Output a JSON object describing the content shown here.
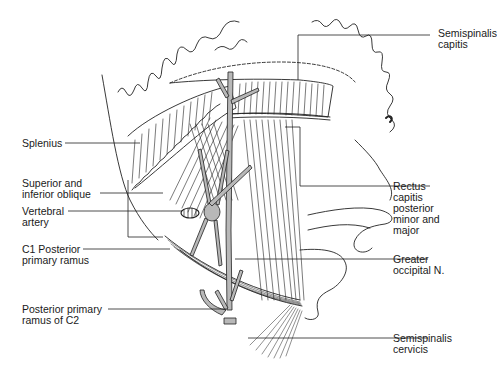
{
  "figure": {
    "labels": {
      "semispinalis_capitis": "Semispinalis\ncapitis",
      "splenius": "Splenius",
      "superior_inferior_oblique": "Superior and\ninferior oblique",
      "vertebral_artery": "Vertebral\nartery",
      "c1_posterior_primary_ramus": "C1 Posterior\nprimary ramus",
      "rectus_capitis": "Rectus\ncapitis\nposterior\nminor and\nmajor",
      "greater_occipital_n": "Greater\noccipital N.",
      "posterior_primary_ramus_c2": "Posterior primary\nramus of C2",
      "semispinalis_cervicis": "Semispinalis\ncervicis"
    },
    "colors": {
      "line": "#222222",
      "nerve_fill": "#b8b8b8",
      "background": "#ffffff"
    }
  }
}
